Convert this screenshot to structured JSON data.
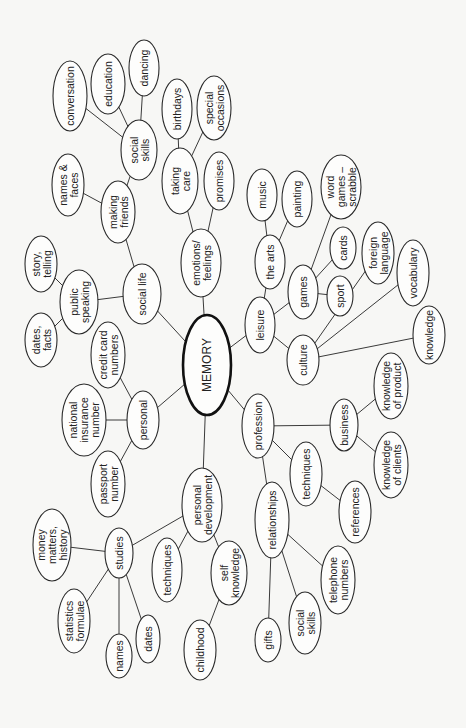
{
  "diagram": {
    "type": "mind-map",
    "orientation": "rotated -90deg (text reads bottom-to-top)",
    "root": {
      "id": "memory",
      "label": "MEMORY"
    },
    "nodes": [
      {
        "id": "memory",
        "lines": [
          "MEMORY"
        ],
        "cx": 207,
        "cy": 365,
        "rx": 24,
        "ry": 50,
        "root": true
      },
      {
        "id": "social-life",
        "lines": [
          "social life"
        ],
        "cx": 142,
        "cy": 294,
        "rx": 19,
        "ry": 30
      },
      {
        "id": "public-speaking",
        "lines": [
          "public",
          "speaking"
        ],
        "cx": 79,
        "cy": 302,
        "rx": 19,
        "ry": 32
      },
      {
        "id": "story-telling",
        "lines": [
          "story,",
          "telling"
        ],
        "cx": 41,
        "cy": 264,
        "rx": 16,
        "ry": 28
      },
      {
        "id": "dates-facts",
        "lines": [
          "dates,",
          "facts"
        ],
        "cx": 41,
        "cy": 340,
        "rx": 16,
        "ry": 27
      },
      {
        "id": "making-friends",
        "lines": [
          "making",
          "friends"
        ],
        "cx": 118,
        "cy": 212,
        "rx": 17,
        "ry": 31
      },
      {
        "id": "names-faces",
        "lines": [
          "names &",
          "faces"
        ],
        "cx": 68,
        "cy": 185,
        "rx": 16,
        "ry": 31
      },
      {
        "id": "social-skills-top",
        "lines": [
          "social",
          "skills"
        ],
        "cx": 139,
        "cy": 150,
        "rx": 18,
        "ry": 30
      },
      {
        "id": "conversation",
        "lines": [
          "conversation"
        ],
        "cx": 70,
        "cy": 96,
        "rx": 17,
        "ry": 35
      },
      {
        "id": "education",
        "lines": [
          "education"
        ],
        "cx": 108,
        "cy": 84,
        "rx": 17,
        "ry": 30
      },
      {
        "id": "dancing",
        "lines": [
          "dancing"
        ],
        "cx": 144,
        "cy": 68,
        "rx": 15,
        "ry": 28
      },
      {
        "id": "emotions-feelings",
        "lines": [
          "emotions/",
          "feelings"
        ],
        "cx": 201,
        "cy": 263,
        "rx": 20,
        "ry": 34
      },
      {
        "id": "taking-care",
        "lines": [
          "taking",
          "care"
        ],
        "cx": 180,
        "cy": 181,
        "rx": 18,
        "ry": 33
      },
      {
        "id": "birthdays",
        "lines": [
          "birthdays"
        ],
        "cx": 177,
        "cy": 109,
        "rx": 15,
        "ry": 30
      },
      {
        "id": "special-occasions",
        "lines": [
          "special",
          "occasions"
        ],
        "cx": 214,
        "cy": 108,
        "rx": 17,
        "ry": 32
      },
      {
        "id": "promises",
        "lines": [
          "promises"
        ],
        "cx": 219,
        "cy": 181,
        "rx": 15,
        "ry": 29
      },
      {
        "id": "leisure",
        "lines": [
          "leisure"
        ],
        "cx": 260,
        "cy": 325,
        "rx": 15,
        "ry": 28
      },
      {
        "id": "the-arts",
        "lines": [
          "the arts"
        ],
        "cx": 270,
        "cy": 262,
        "rx": 15,
        "ry": 27
      },
      {
        "id": "music",
        "lines": [
          "music"
        ],
        "cx": 262,
        "cy": 195,
        "rx": 15,
        "ry": 26
      },
      {
        "id": "painting",
        "lines": [
          "painting"
        ],
        "cx": 297,
        "cy": 199,
        "rx": 15,
        "ry": 28
      },
      {
        "id": "games",
        "lines": [
          "games"
        ],
        "cx": 303,
        "cy": 292,
        "rx": 15,
        "ry": 27
      },
      {
        "id": "word-games-scrabble",
        "lines": [
          "word",
          "games –",
          "scrabble"
        ],
        "cx": 341,
        "cy": 187,
        "rx": 20,
        "ry": 32
      },
      {
        "id": "cards",
        "lines": [
          "cards"
        ],
        "cx": 343,
        "cy": 248,
        "rx": 13,
        "ry": 21
      },
      {
        "id": "sport",
        "lines": [
          "sport"
        ],
        "cx": 340,
        "cy": 296,
        "rx": 13,
        "ry": 20
      },
      {
        "id": "foreign-language",
        "lines": [
          "foreign",
          "language"
        ],
        "cx": 378,
        "cy": 253,
        "rx": 16,
        "ry": 31
      },
      {
        "id": "vocabulary",
        "lines": [
          "vocabulary"
        ],
        "cx": 413,
        "cy": 273,
        "rx": 16,
        "ry": 33
      },
      {
        "id": "culture",
        "lines": [
          "culture"
        ],
        "cx": 303,
        "cy": 360,
        "rx": 16,
        "ry": 25
      },
      {
        "id": "knowledge-culture",
        "lines": [
          "knowledge"
        ],
        "cx": 429,
        "cy": 335,
        "rx": 16,
        "ry": 29
      },
      {
        "id": "profession",
        "lines": [
          "profession"
        ],
        "cx": 258,
        "cy": 426,
        "rx": 16,
        "ry": 32
      },
      {
        "id": "business",
        "lines": [
          "business"
        ],
        "cx": 344,
        "cy": 425,
        "rx": 14,
        "ry": 26
      },
      {
        "id": "knowledge-of-product",
        "lines": [
          "knowledge",
          "of product"
        ],
        "cx": 391,
        "cy": 386,
        "rx": 17,
        "ry": 33
      },
      {
        "id": "knowledge-of-clients",
        "lines": [
          "knowledge",
          "of clients"
        ],
        "cx": 391,
        "cy": 465,
        "rx": 17,
        "ry": 33
      },
      {
        "id": "techniques-prof",
        "lines": [
          "techniques"
        ],
        "cx": 306,
        "cy": 474,
        "rx": 16,
        "ry": 32
      },
      {
        "id": "references",
        "lines": [
          "references"
        ],
        "cx": 355,
        "cy": 512,
        "rx": 16,
        "ry": 31
      },
      {
        "id": "relationships",
        "lines": [
          "relationships"
        ],
        "cx": 272,
        "cy": 520,
        "rx": 17,
        "ry": 38
      },
      {
        "id": "telephone-numbers",
        "lines": [
          "telephone",
          "numbers"
        ],
        "cx": 338,
        "cy": 580,
        "rx": 17,
        "ry": 34
      },
      {
        "id": "social-skills-rel",
        "lines": [
          "social",
          "skills"
        ],
        "cx": 305,
        "cy": 623,
        "rx": 16,
        "ry": 31
      },
      {
        "id": "gifts",
        "lines": [
          "gifts"
        ],
        "cx": 268,
        "cy": 640,
        "rx": 13,
        "ry": 22
      },
      {
        "id": "personal",
        "lines": [
          "personal"
        ],
        "cx": 143,
        "cy": 420,
        "rx": 16,
        "ry": 29
      },
      {
        "id": "credit-card-numbers",
        "lines": [
          "credit card",
          "numbers"
        ],
        "cx": 108,
        "cy": 355,
        "rx": 17,
        "ry": 33
      },
      {
        "id": "national-insurance-number",
        "lines": [
          "national",
          "insurance",
          "number"
        ],
        "cx": 84,
        "cy": 420,
        "rx": 22,
        "ry": 36
      },
      {
        "id": "passport-number",
        "lines": [
          "passport",
          "number"
        ],
        "cx": 108,
        "cy": 484,
        "rx": 17,
        "ry": 33
      },
      {
        "id": "personal-development",
        "lines": [
          "personal",
          "development"
        ],
        "cx": 202,
        "cy": 505,
        "rx": 20,
        "ry": 37
      },
      {
        "id": "studies",
        "lines": [
          "studies"
        ],
        "cx": 119,
        "cy": 553,
        "rx": 14,
        "ry": 25
      },
      {
        "id": "money-matters-history",
        "lines": [
          "money",
          "matters,",
          "history"
        ],
        "cx": 52,
        "cy": 545,
        "rx": 19,
        "ry": 36
      },
      {
        "id": "statistics-formulae",
        "lines": [
          "statistics",
          "formulae"
        ],
        "cx": 74,
        "cy": 621,
        "rx": 16,
        "ry": 32
      },
      {
        "id": "names",
        "lines": [
          "names"
        ],
        "cx": 119,
        "cy": 656,
        "rx": 13,
        "ry": 22
      },
      {
        "id": "dates-studies",
        "lines": [
          "dates"
        ],
        "cx": 148,
        "cy": 639,
        "rx": 12,
        "ry": 24
      },
      {
        "id": "techniques-pd",
        "lines": [
          "techniques"
        ],
        "cx": 167,
        "cy": 570,
        "rx": 15,
        "ry": 32
      },
      {
        "id": "self-knowledge",
        "lines": [
          "self",
          "knowledge"
        ],
        "cx": 229,
        "cy": 573,
        "rx": 18,
        "ry": 32
      },
      {
        "id": "childhood",
        "lines": [
          "childhood"
        ],
        "cx": 200,
        "cy": 650,
        "rx": 16,
        "ry": 30
      }
    ],
    "edges": [
      [
        "memory",
        "social-life"
      ],
      [
        "memory",
        "emotions-feelings"
      ],
      [
        "memory",
        "leisure"
      ],
      [
        "memory",
        "profession"
      ],
      [
        "memory",
        "personal"
      ],
      [
        "memory",
        "personal-development"
      ],
      [
        "social-life",
        "public-speaking"
      ],
      [
        "social-life",
        "making-friends"
      ],
      [
        "public-speaking",
        "story-telling"
      ],
      [
        "public-speaking",
        "dates-facts"
      ],
      [
        "making-friends",
        "names-faces"
      ],
      [
        "making-friends",
        "social-skills-top"
      ],
      [
        "social-skills-top",
        "conversation"
      ],
      [
        "social-skills-top",
        "education"
      ],
      [
        "social-skills-top",
        "dancing"
      ],
      [
        "emotions-feelings",
        "taking-care"
      ],
      [
        "emotions-feelings",
        "promises"
      ],
      [
        "taking-care",
        "birthdays"
      ],
      [
        "taking-care",
        "special-occasions"
      ],
      [
        "leisure",
        "the-arts"
      ],
      [
        "leisure",
        "games"
      ],
      [
        "leisure",
        "culture"
      ],
      [
        "the-arts",
        "music"
      ],
      [
        "the-arts",
        "painting"
      ],
      [
        "games",
        "word-games-scrabble"
      ],
      [
        "games",
        "cards"
      ],
      [
        "games",
        "sport"
      ],
      [
        "culture",
        "foreign-language"
      ],
      [
        "culture",
        "vocabulary"
      ],
      [
        "culture",
        "knowledge-culture"
      ],
      [
        "profession",
        "business"
      ],
      [
        "profession",
        "techniques-prof"
      ],
      [
        "profession",
        "relationships"
      ],
      [
        "business",
        "knowledge-of-product"
      ],
      [
        "business",
        "knowledge-of-clients"
      ],
      [
        "techniques-prof",
        "references"
      ],
      [
        "relationships",
        "telephone-numbers"
      ],
      [
        "relationships",
        "social-skills-rel"
      ],
      [
        "relationships",
        "gifts"
      ],
      [
        "personal",
        "credit-card-numbers"
      ],
      [
        "personal",
        "national-insurance-number"
      ],
      [
        "personal",
        "passport-number"
      ],
      [
        "personal-development",
        "studies"
      ],
      [
        "personal-development",
        "techniques-pd"
      ],
      [
        "personal-development",
        "self-knowledge"
      ],
      [
        "studies",
        "money-matters-history"
      ],
      [
        "studies",
        "statistics-formulae"
      ],
      [
        "studies",
        "names"
      ],
      [
        "studies",
        "dates-studies"
      ],
      [
        "self-knowledge",
        "childhood"
      ]
    ]
  }
}
